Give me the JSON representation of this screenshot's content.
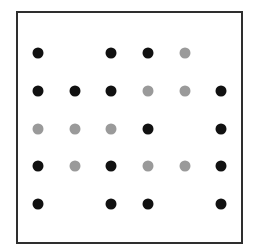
{
  "diagram": {
    "type": "dot-grid",
    "columns": 6,
    "rows": 5,
    "legend_colors": {
      "B": "#111111",
      "G": "#9a9a9a"
    },
    "column_x": [
      38,
      75,
      111,
      148,
      185,
      221
    ],
    "row_y": [
      53,
      91,
      129,
      166,
      204
    ],
    "grid": [
      [
        "B",
        "",
        "B",
        "B",
        "G",
        ""
      ],
      [
        "B",
        "B",
        "B",
        "G",
        "G",
        "B"
      ],
      [
        "G",
        "G",
        "G",
        "B",
        "",
        "B"
      ],
      [
        "B",
        "G",
        "B",
        "G",
        "G",
        "B"
      ],
      [
        "B",
        "",
        "B",
        "B",
        "",
        "B"
      ]
    ]
  }
}
